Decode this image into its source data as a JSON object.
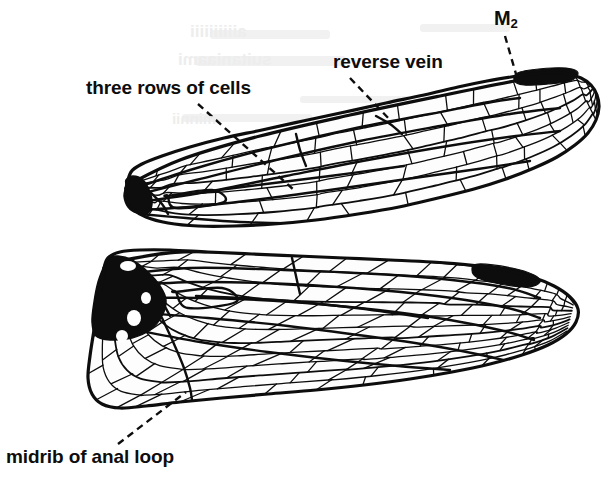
{
  "figure": {
    "background_color": "#ffffff",
    "ink_color": "#0d0d0d",
    "width": 616,
    "height": 481
  },
  "labels": [
    {
      "id": "three-rows",
      "text": "three rows of cells",
      "x": 86,
      "y": 78,
      "font_size": 19,
      "leader": {
        "from": [
          198,
          104
        ],
        "to": [
          294,
          190
        ],
        "style": "dashed"
      }
    },
    {
      "id": "reverse-vein",
      "text": "reverse vein",
      "x": 333,
      "y": 52,
      "font_size": 19,
      "leader": {
        "from": [
          350,
          78
        ],
        "to": [
          392,
          122
        ],
        "style": "dashed"
      }
    },
    {
      "id": "m2",
      "text": "M",
      "subscript": "2",
      "x": 494,
      "y": 8,
      "font_size": 20,
      "leader": {
        "from": [
          505,
          36
        ],
        "to": [
          516,
          74
        ],
        "style": "dashed"
      }
    },
    {
      "id": "midrib-anal-loop",
      "text": "midrib of anal loop",
      "x": 6,
      "y": 447,
      "font_size": 19,
      "leader": {
        "from": [
          118,
          444
        ],
        "to": [
          186,
          392
        ],
        "style": "dashed"
      }
    }
  ],
  "ghost_text": [
    {
      "id": "ghost-a",
      "text": "aiiiiiiiiii",
      "x": 190,
      "y": 22
    },
    {
      "id": "ghost-b",
      "text": "suitaniaami",
      "x": 178,
      "y": 50
    },
    {
      "id": "ghost-c",
      "text": "minnii",
      "x": 172,
      "y": 110
    }
  ],
  "wings": [
    {
      "id": "forewing",
      "name": "forewing",
      "base": [
        126,
        188
      ],
      "tip": [
        601,
        78
      ],
      "tilt_degrees": -13,
      "length": 488,
      "max_width": 86,
      "outline": [
        [
          126,
          188
        ],
        [
          131,
          172
        ],
        [
          142,
          164
        ],
        [
          162,
          156
        ],
        [
          190,
          147
        ],
        [
          224,
          138
        ],
        [
          262,
          130
        ],
        [
          303,
          121
        ],
        [
          345,
          112
        ],
        [
          386,
          103
        ],
        [
          424,
          95
        ],
        [
          458,
          87
        ],
        [
          487,
          81
        ],
        [
          511,
          77
        ],
        [
          533,
          74
        ],
        [
          552,
          73
        ],
        [
          568,
          74
        ],
        [
          581,
          78
        ],
        [
          591,
          85
        ],
        [
          597,
          95
        ],
        [
          599,
          107
        ],
        [
          596,
          120
        ],
        [
          588,
          133
        ],
        [
          575,
          145
        ],
        [
          557,
          157
        ],
        [
          534,
          168
        ],
        [
          506,
          179
        ],
        [
          474,
          189
        ],
        [
          438,
          198
        ],
        [
          399,
          207
        ],
        [
          358,
          214
        ],
        [
          316,
          220
        ],
        [
          274,
          224
        ],
        [
          234,
          226
        ],
        [
          198,
          226
        ],
        [
          168,
          223
        ],
        [
          146,
          217
        ],
        [
          132,
          208
        ],
        [
          126,
          198
        ],
        [
          126,
          188
        ]
      ],
      "basal_patch": {
        "shape": [
          [
            126,
            186
          ],
          [
            124,
            196
          ],
          [
            128,
            207
          ],
          [
            137,
            213
          ],
          [
            148,
            213
          ],
          [
            152,
            204
          ],
          [
            150,
            192
          ],
          [
            143,
            180
          ],
          [
            133,
            176
          ],
          [
            126,
            180
          ]
        ],
        "color": "#0d0d0d"
      },
      "pterostigma": {
        "shape": [
          [
            520,
            72
          ],
          [
            552,
            68
          ],
          [
            572,
            69
          ],
          [
            578,
            74
          ],
          [
            570,
            81
          ],
          [
            548,
            84
          ],
          [
            524,
            85
          ],
          [
            514,
            80
          ]
        ],
        "color": "#0d0d0d"
      },
      "major_veins": [
        {
          "name": "costa",
          "path": [
            [
              126,
              186
            ],
            [
              180,
              160
            ],
            [
              260,
              136
            ],
            [
              350,
              115
            ],
            [
              440,
              96
            ],
            [
              520,
              80
            ],
            [
              570,
              72
            ],
            [
              592,
              80
            ]
          ]
        },
        {
          "name": "subcosta",
          "path": [
            [
              130,
              190
            ],
            [
              190,
              170
            ],
            [
              270,
              148
            ],
            [
              356,
              128
            ],
            [
              430,
              114
            ],
            [
              492,
              102
            ],
            [
              520,
              98
            ]
          ]
        },
        {
          "name": "radius-R1",
          "path": [
            [
              132,
              196
            ],
            [
              196,
              180
            ],
            [
              276,
              160
            ],
            [
              360,
              141
            ],
            [
              440,
              126
            ],
            [
              510,
              114
            ],
            [
              560,
              108
            ]
          ]
        },
        {
          "name": "media-M2",
          "path": [
            [
              140,
              202
            ],
            [
              206,
              192
            ],
            [
              286,
              176
            ],
            [
              368,
              160
            ],
            [
              448,
              146
            ],
            [
              516,
              136
            ],
            [
              560,
              131
            ]
          ]
        },
        {
          "name": "cubitus",
          "path": [
            [
              142,
              210
            ],
            [
              200,
              206
            ],
            [
              270,
              198
            ],
            [
              344,
              188
            ],
            [
              414,
              178
            ],
            [
              478,
              169
            ],
            [
              530,
              161
            ]
          ]
        },
        {
          "name": "anal-vein",
          "path": [
            [
              140,
              214
            ],
            [
              186,
              218
            ],
            [
              240,
              222
            ],
            [
              296,
              223
            ],
            [
              348,
              219
            ],
            [
              396,
              213
            ]
          ]
        },
        {
          "name": "arculus",
          "path": [
            [
              150,
              192
            ],
            [
              162,
              204
            ],
            [
              168,
              214
            ]
          ]
        },
        {
          "name": "discoidal-tri",
          "path": [
            [
              168,
              196
            ],
            [
              212,
              190
            ],
            [
              224,
              202
            ],
            [
              176,
              208
            ],
            [
              168,
              196
            ]
          ]
        },
        {
          "name": "nodal-crossing",
          "path": [
            [
              296,
              134
            ],
            [
              300,
              150
            ],
            [
              306,
              166
            ]
          ]
        },
        {
          "name": "long-cell-a",
          "path": [
            [
              176,
              196
            ],
            [
              250,
              186
            ],
            [
              330,
              176
            ],
            [
              404,
              166
            ]
          ]
        },
        {
          "name": "reverse-vein",
          "path": [
            [
              376,
              116
            ],
            [
              390,
              124
            ],
            [
              402,
              134
            ]
          ]
        }
      ],
      "cell_rows": 7,
      "cross_vein_count": 78,
      "note": "narrow, tilted upward; three rows of cells visible in the mid-basal field"
    },
    {
      "id": "hindwing",
      "name": "hindwing",
      "base": [
        104,
        268
      ],
      "tip": [
        586,
        300
      ],
      "tilt_degrees": 2,
      "length": 486,
      "max_width": 132,
      "outline": [
        [
          104,
          268
        ],
        [
          108,
          258
        ],
        [
          120,
          252
        ],
        [
          140,
          250
        ],
        [
          170,
          250
        ],
        [
          208,
          252
        ],
        [
          252,
          254
        ],
        [
          298,
          256
        ],
        [
          344,
          258
        ],
        [
          390,
          260
        ],
        [
          432,
          262
        ],
        [
          470,
          265
        ],
        [
          504,
          270
        ],
        [
          532,
          277
        ],
        [
          554,
          286
        ],
        [
          570,
          297
        ],
        [
          578,
          309
        ],
        [
          576,
          322
        ],
        [
          566,
          334
        ],
        [
          548,
          345
        ],
        [
          522,
          355
        ],
        [
          490,
          364
        ],
        [
          452,
          372
        ],
        [
          410,
          379
        ],
        [
          364,
          385
        ],
        [
          316,
          390
        ],
        [
          268,
          394
        ],
        [
          222,
          398
        ],
        [
          180,
          402
        ],
        [
          146,
          406
        ],
        [
          120,
          408
        ],
        [
          102,
          404
        ],
        [
          92,
          394
        ],
        [
          88,
          378
        ],
        [
          90,
          356
        ],
        [
          94,
          330
        ],
        [
          98,
          304
        ],
        [
          102,
          284
        ],
        [
          104,
          268
        ]
      ],
      "basal_patch": {
        "shape": [
          [
            104,
            266
          ],
          [
            98,
            282
          ],
          [
            94,
            302
          ],
          [
            92,
            322
          ],
          [
            96,
            336
          ],
          [
            110,
            340
          ],
          [
            132,
            338
          ],
          [
            150,
            330
          ],
          [
            162,
            316
          ],
          [
            166,
            300
          ],
          [
            160,
            286
          ],
          [
            148,
            272
          ],
          [
            132,
            260
          ],
          [
            118,
            256
          ],
          [
            108,
            258
          ]
        ],
        "color": "#0d0d0d",
        "white_spots": [
          {
            "cx": 134,
            "cy": 318,
            "rx": 7,
            "ry": 8
          },
          {
            "cx": 122,
            "cy": 336,
            "rx": 6,
            "ry": 6
          },
          {
            "cx": 146,
            "cy": 298,
            "rx": 5,
            "ry": 6
          },
          {
            "cx": 128,
            "cy": 266,
            "rx": 8,
            "ry": 5
          }
        ]
      },
      "pterostigma": {
        "shape": [
          [
            478,
            264
          ],
          [
            512,
            268
          ],
          [
            534,
            275
          ],
          [
            540,
            282
          ],
          [
            528,
            287
          ],
          [
            500,
            284
          ],
          [
            478,
            278
          ],
          [
            472,
            270
          ]
        ],
        "color": "#0d0d0d"
      },
      "major_veins": [
        {
          "name": "costa",
          "path": [
            [
              104,
              264
            ],
            [
              180,
              252
            ],
            [
              280,
              254
            ],
            [
              380,
              258
            ],
            [
              460,
              264
            ],
            [
              520,
              272
            ],
            [
              558,
              286
            ],
            [
              574,
              302
            ]
          ]
        },
        {
          "name": "subcosta",
          "path": [
            [
              112,
              276
            ],
            [
              190,
              268
            ],
            [
              284,
              270
            ],
            [
              376,
              274
            ],
            [
              452,
              280
            ],
            [
              508,
              288
            ],
            [
              540,
              298
            ]
          ]
        },
        {
          "name": "radius-R1",
          "path": [
            [
              118,
              286
            ],
            [
              196,
              282
            ],
            [
              288,
              284
            ],
            [
              378,
              290
            ],
            [
              452,
              298
            ],
            [
              508,
              308
            ],
            [
              540,
              318
            ]
          ]
        },
        {
          "name": "media",
          "path": [
            [
              126,
              298
            ],
            [
              204,
              298
            ],
            [
              292,
              302
            ],
            [
              378,
              310
            ],
            [
              450,
              320
            ],
            [
              504,
              331
            ],
            [
              534,
              340
            ]
          ]
        },
        {
          "name": "cubitus",
          "path": [
            [
              132,
              312
            ],
            [
              208,
              318
            ],
            [
              288,
              326
            ],
            [
              366,
              336
            ],
            [
              434,
              346
            ],
            [
              486,
              356
            ],
            [
              518,
              364
            ]
          ]
        },
        {
          "name": "anal-vein",
          "path": [
            [
              136,
              330
            ],
            [
              200,
              342
            ],
            [
              268,
              352
            ],
            [
              336,
              360
            ],
            [
              398,
              366
            ],
            [
              450,
              370
            ]
          ]
        },
        {
          "name": "anal-loop-midrib",
          "path": [
            [
              162,
              318
            ],
            [
              174,
              344
            ],
            [
              184,
              368
            ],
            [
              190,
              388
            ],
            [
              192,
              400
            ]
          ]
        },
        {
          "name": "arculus",
          "path": [
            [
              150,
              288
            ],
            [
              162,
              302
            ],
            [
              170,
              316
            ]
          ]
        },
        {
          "name": "discoidal-tri",
          "path": [
            [
              176,
              292
            ],
            [
              222,
              288
            ],
            [
              236,
              302
            ],
            [
              188,
              308
            ],
            [
              176,
              292
            ]
          ]
        },
        {
          "name": "nodal-crossing",
          "path": [
            [
              292,
              258
            ],
            [
              296,
              276
            ],
            [
              300,
              294
            ]
          ]
        },
        {
          "name": "long-cell-b",
          "path": [
            [
              196,
              296
            ],
            [
              276,
              300
            ],
            [
              356,
              308
            ],
            [
              428,
              318
            ]
          ]
        }
      ],
      "cell_rows": 11,
      "cross_vein_count": 126,
      "note": "broader with rounded anal lobe; midrib of anal loop runs through the lower basal field"
    }
  ],
  "style": {
    "vein_color": "#0d0d0d",
    "cell_fill": "#fdfdfd",
    "margin_stroke_width": 3.2,
    "major_vein_width": 2.4,
    "cross_vein_width": 1.3,
    "leader_dash": "7,5",
    "leader_width": 2.4
  }
}
